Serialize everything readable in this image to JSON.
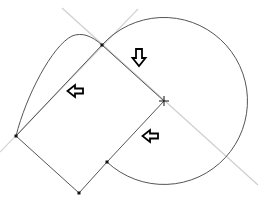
{
  "diagram": {
    "width": 262,
    "height": 198,
    "colors": {
      "background": "#ffffff",
      "construction": "#c8c8c8",
      "curve": "#555555",
      "points": "#111111",
      "arrow": "#000000"
    },
    "center": {
      "x": 164,
      "y": 101
    },
    "radius": 83.5,
    "points": [
      {
        "name": "tangent-point",
        "x": 102,
        "y": 45
      },
      {
        "name": "left-corner",
        "x": 16,
        "y": 136
      },
      {
        "name": "bottom-corner",
        "x": 79,
        "y": 193
      },
      {
        "name": "arc-end",
        "x": 107,
        "y": 162
      }
    ],
    "arrows": [
      {
        "name": "arrow-down",
        "direction": "down",
        "x": 139,
        "y": 57
      },
      {
        "name": "arrow-left-upper",
        "direction": "left",
        "x": 75,
        "y": 91
      },
      {
        "name": "arrow-left-lower",
        "direction": "left",
        "x": 150,
        "y": 136
      }
    ]
  }
}
